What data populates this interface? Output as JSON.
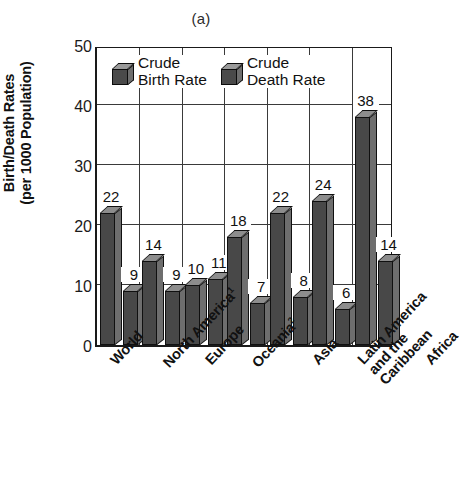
{
  "chart_data": {
    "type": "bar",
    "title": "(a)",
    "xlabel": "",
    "ylabel": "Birth/Death Rates (per 1000 Population)",
    "ylabel_line1": "Birth/Death Rates",
    "ylabel_line2": "(per 1000 Population)",
    "ylim": [
      0,
      50
    ],
    "yticks": [
      0,
      10,
      20,
      30,
      40,
      50
    ],
    "grid": true,
    "legend_position": "inside-top-left",
    "categories": [
      "World",
      "North America¹",
      "Europe",
      "Oceania²",
      "Asia",
      "Latin America and the Caribbean",
      "Africa"
    ],
    "series": [
      {
        "name": "Crude Birth Rate",
        "values": [
          22,
          14,
          10,
          18,
          22,
          24,
          38
        ]
      },
      {
        "name": "Crude Death Rate",
        "values": [
          9,
          9,
          11,
          7,
          8,
          6,
          14
        ]
      }
    ]
  },
  "axis": {
    "ytick_labels": [
      "50",
      "40",
      "30",
      "20",
      "10",
      "0"
    ],
    "ylabel_line1": "Birth/Death Rates",
    "ylabel_line2": "(per 1000 Population)"
  },
  "title": {
    "text": "(a)"
  },
  "legend": {
    "items": [
      {
        "line1": "Crude",
        "line2": "Birth Rate"
      },
      {
        "line1": "Crude",
        "line2": "Death Rate"
      }
    ]
  },
  "xcategories": [
    {
      "text": "World",
      "sup": ""
    },
    {
      "text": "North America",
      "sup": "1"
    },
    {
      "text": "Europe",
      "sup": ""
    },
    {
      "text": "Oceania",
      "sup": "2"
    },
    {
      "text": "Asia",
      "sup": ""
    },
    {
      "text_l1": "Latin America",
      "text_l2": "and the",
      "text_l3": "Caribbean",
      "sup": ""
    },
    {
      "text": "Africa",
      "sup": ""
    }
  ],
  "bar_labels": {
    "birth": [
      "22",
      "14",
      "10",
      "18",
      "22",
      "24",
      "38"
    ],
    "death": [
      "9",
      "9",
      "11",
      "7",
      "8",
      "6",
      "14"
    ]
  },
  "colors": {
    "bar_front": "#484848",
    "bar_side": "#6e6e6e",
    "bar_top": "#8d8d8d",
    "axis": "#1a1a1a",
    "grid": "#3a3a3a",
    "background": "#ffffff"
  }
}
